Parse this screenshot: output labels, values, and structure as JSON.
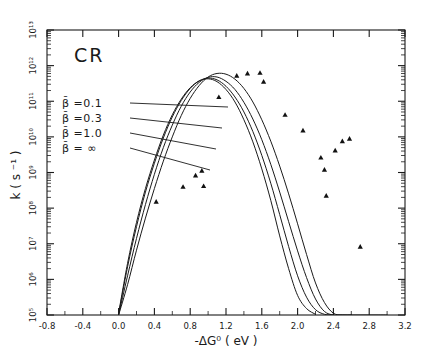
{
  "figure": {
    "title": "CR",
    "background": "#ffffff",
    "ink": "#1a1a1a"
  },
  "chart_data": {
    "type": "line",
    "title": "CR",
    "xlabel": "-ΔG⁰ ( eV )",
    "ylabel": "k  ( s ⁻¹ )",
    "xlim": [
      -0.8,
      3.2
    ],
    "ylim_log10": [
      5,
      13
    ],
    "grid": false,
    "legend_position": "upper-left-inside",
    "xticks": [
      "-0.8",
      "-0.4",
      "0.0",
      "0.4",
      "0.8",
      "1.2",
      "1.6",
      "2.0",
      "2.4",
      "2.8",
      "3.2"
    ],
    "xtick_values": [
      -0.8,
      -0.4,
      0.0,
      0.4,
      0.8,
      1.2,
      1.6,
      2.0,
      2.4,
      2.8,
      3.2
    ],
    "ytick_labels": [
      "10⁵",
      "10⁶",
      "10⁷",
      "10⁸",
      "10⁹",
      "10¹⁰",
      "10¹¹",
      "10¹²",
      "10¹³"
    ],
    "ytick_exponents": [
      5,
      6,
      7,
      8,
      9,
      10,
      11,
      12,
      13
    ],
    "yscale": "log",
    "minor_ticks": "log-decade",
    "series": [
      {
        "name": "β̄ =0.1",
        "legend_label": "β̄ =0.1",
        "beta": "0.1",
        "x": [
          0.0,
          0.1,
          0.2,
          0.3,
          0.4,
          0.5,
          0.6,
          0.7,
          0.8,
          0.9,
          1.0,
          1.1,
          1.2,
          1.3,
          1.4,
          1.5,
          1.6,
          1.7,
          1.8,
          1.9,
          2.0,
          2.1,
          2.2
        ],
        "log10_y": [
          5.05,
          6.45,
          7.6,
          8.55,
          9.35,
          10.05,
          10.62,
          11.06,
          11.38,
          11.57,
          11.63,
          11.55,
          11.33,
          10.98,
          10.48,
          9.86,
          9.1,
          8.22,
          7.22,
          6.3,
          5.55,
          5.18,
          5.02
        ]
      },
      {
        "name": "β̄ =0.3",
        "legend_label": "β̄ =0.3",
        "beta": "0.3",
        "x": [
          0.0,
          0.1,
          0.2,
          0.3,
          0.4,
          0.5,
          0.6,
          0.7,
          0.8,
          0.9,
          1.0,
          1.1,
          1.2,
          1.3,
          1.4,
          1.5,
          1.6,
          1.7,
          1.8,
          1.9,
          2.0,
          2.1,
          2.2,
          2.3,
          2.4
        ],
        "log10_y": [
          5.02,
          6.35,
          7.48,
          8.45,
          9.26,
          9.97,
          10.56,
          11.02,
          11.36,
          11.57,
          11.65,
          11.6,
          11.42,
          11.12,
          10.7,
          10.15,
          9.48,
          8.7,
          7.82,
          6.92,
          6.1,
          5.5,
          5.15,
          5.02,
          5.0
        ]
      },
      {
        "name": "β̄ =1.0",
        "legend_label": "β̄ =1.0",
        "beta": "1.0",
        "x": [
          0.0,
          0.1,
          0.2,
          0.3,
          0.4,
          0.5,
          0.6,
          0.7,
          0.8,
          0.9,
          1.0,
          1.1,
          1.2,
          1.3,
          1.4,
          1.5,
          1.6,
          1.7,
          1.8,
          1.9,
          2.0,
          2.1,
          2.2,
          2.3,
          2.4,
          2.5,
          2.6
        ],
        "log10_y": [
          5.0,
          6.1,
          7.15,
          8.1,
          8.95,
          9.7,
          10.33,
          10.86,
          11.26,
          11.53,
          11.67,
          11.68,
          11.56,
          11.33,
          10.97,
          10.5,
          9.92,
          9.23,
          8.45,
          7.62,
          6.8,
          6.05,
          5.45,
          5.1,
          5.0,
          5.0,
          5.0
        ]
      },
      {
        "name": "β̄ = ∞",
        "legend_label": "β̄ = ∞",
        "beta": "∞",
        "x": [
          0.0,
          0.1,
          0.2,
          0.3,
          0.4,
          0.5,
          0.6,
          0.7,
          0.8,
          0.9,
          1.0,
          1.1,
          1.2,
          1.3,
          1.4,
          1.5,
          1.6,
          1.7,
          1.8,
          1.9,
          2.0,
          2.1,
          2.2,
          2.3,
          2.4,
          2.5,
          2.6,
          2.7,
          2.8,
          2.9,
          3.0
        ],
        "log10_y": [
          5.0,
          5.85,
          6.82,
          7.72,
          8.55,
          9.32,
          10.0,
          10.6,
          11.08,
          11.44,
          11.68,
          11.78,
          11.76,
          11.62,
          11.36,
          10.98,
          10.48,
          9.88,
          9.18,
          8.4,
          7.56,
          6.7,
          5.9,
          5.35,
          5.05,
          5.0,
          5.0,
          5.0,
          5.0,
          5.0,
          5.0
        ]
      }
    ],
    "markers": {
      "shape": "triangle",
      "color": "#111111",
      "points": [
        {
          "x": 0.72,
          "log10_y": 8.6
        },
        {
          "x": 0.86,
          "log10_y": 8.92
        },
        {
          "x": 0.93,
          "log10_y": 9.05
        },
        {
          "x": 0.95,
          "log10_y": 8.62
        },
        {
          "x": 1.12,
          "log10_y": 11.12
        },
        {
          "x": 1.32,
          "log10_y": 11.72
        },
        {
          "x": 1.44,
          "log10_y": 11.78
        },
        {
          "x": 1.58,
          "log10_y": 11.8
        },
        {
          "x": 1.62,
          "log10_y": 11.55
        },
        {
          "x": 1.86,
          "log10_y": 10.62
        },
        {
          "x": 2.06,
          "log10_y": 10.18
        },
        {
          "x": 2.26,
          "log10_y": 9.42
        },
        {
          "x": 2.3,
          "log10_y": 9.08
        },
        {
          "x": 2.32,
          "log10_y": 8.35
        },
        {
          "x": 2.42,
          "log10_y": 9.62
        },
        {
          "x": 2.5,
          "log10_y": 9.88
        },
        {
          "x": 2.58,
          "log10_y": 9.95
        },
        {
          "x": 2.7,
          "log10_y": 6.92
        },
        {
          "x": 0.42,
          "log10_y": 8.18
        }
      ]
    },
    "legend_leader_lines": true
  }
}
